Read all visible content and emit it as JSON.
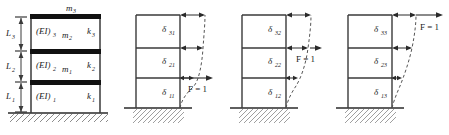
{
  "figure": {
    "type": "structural-diagram",
    "stories": 3
  },
  "colors": {
    "line": "#3a3a3a",
    "heavy_beam": "#111111",
    "dashed": "#555555",
    "hatch": "#4a4a4a",
    "text": "#1a1a1a"
  },
  "panels": [
    {
      "id": "frame-properties",
      "name": "property-frame",
      "top_mass": {
        "base": "m",
        "sub": "3"
      },
      "heights": [
        {
          "base": "L",
          "sub": "3"
        },
        {
          "base": "L",
          "sub": "2"
        },
        {
          "base": "L",
          "sub": "1"
        }
      ],
      "stiffness_labels": [
        {
          "base": "(EI)",
          "sub": "3"
        },
        {
          "base": "(EI)",
          "sub": "2"
        },
        {
          "base": "(EI)",
          "sub": "1"
        }
      ],
      "masses": [
        {
          "base": "m",
          "sub": "2"
        },
        {
          "base": "m",
          "sub": "1"
        }
      ],
      "springs": [
        {
          "base": "k",
          "sub": "3"
        },
        {
          "base": "k",
          "sub": "2"
        },
        {
          "base": "k",
          "sub": "1"
        }
      ]
    },
    {
      "id": "influence-case-1",
      "name": "unit-load-floor-1",
      "load_label": "F = 1",
      "load_floor": 1,
      "deflections": [
        {
          "base": "δ",
          "sub": "31"
        },
        {
          "base": "δ",
          "sub": "21"
        },
        {
          "base": "δ",
          "sub": "11"
        }
      ]
    },
    {
      "id": "influence-case-2",
      "name": "unit-load-floor-2",
      "load_label": "F = 1",
      "load_floor": 2,
      "deflections": [
        {
          "base": "δ",
          "sub": "32"
        },
        {
          "base": "δ",
          "sub": "22"
        },
        {
          "base": "δ",
          "sub": "12"
        }
      ]
    },
    {
      "id": "influence-case-3",
      "name": "unit-load-floor-3",
      "load_label": "F = 1",
      "load_floor": 3,
      "deflections": [
        {
          "base": "δ",
          "sub": "33"
        },
        {
          "base": "δ",
          "sub": "23"
        },
        {
          "base": "δ",
          "sub": "13"
        }
      ]
    }
  ]
}
